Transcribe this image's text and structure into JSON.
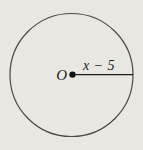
{
  "figure": {
    "type": "geometry-circle-diagram",
    "center_label": "O",
    "radius_label": "x − 5"
  },
  "colors": {
    "background": "#e9e7e2",
    "circle_stroke": "#4b4a47",
    "radius_stroke": "#1c1c1c",
    "dot_fill": "#111111",
    "text": "#1c1c1c"
  }
}
